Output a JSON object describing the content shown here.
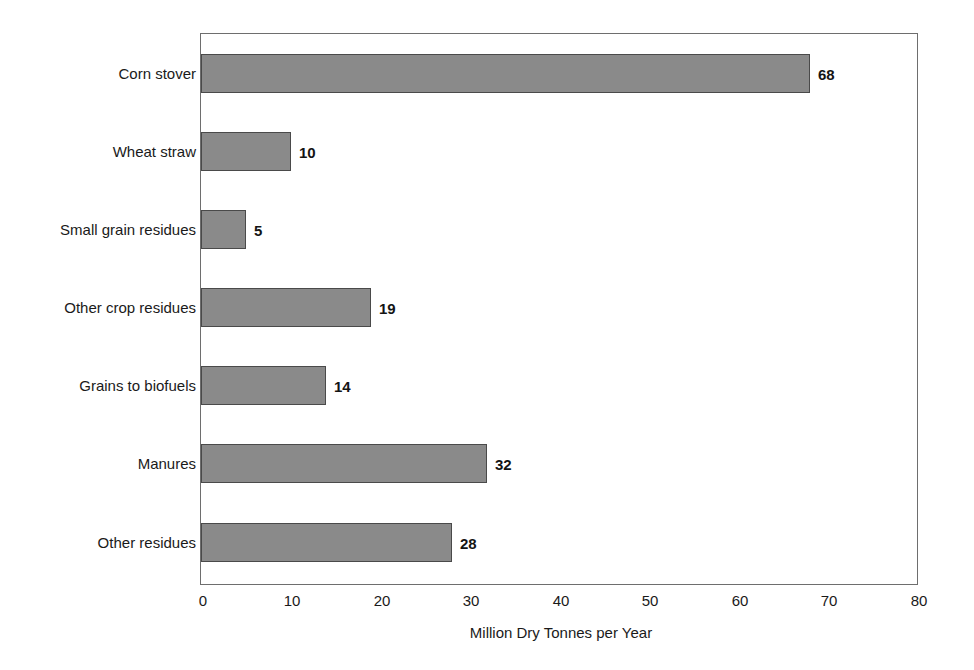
{
  "chart_data": {
    "type": "bar",
    "orientation": "horizontal",
    "title": "",
    "xlabel": "Million Dry Tonnes per Year",
    "ylabel": "",
    "xlim": [
      0,
      80
    ],
    "xticks": [
      0,
      10,
      20,
      30,
      40,
      50,
      60,
      70,
      80
    ],
    "xtick_labels": [
      "0",
      "10",
      "20",
      "30",
      "40",
      "50",
      "60",
      "70",
      "80"
    ],
    "grid": false,
    "legend": false,
    "categories": [
      "Corn stover",
      "Wheat straw",
      "Small grain residues",
      "Other crop residues",
      "Grains to biofuels",
      "Manures",
      "Other residues"
    ],
    "values": [
      68,
      10,
      5,
      19,
      14,
      32,
      28
    ],
    "data_labels": [
      "68",
      "10",
      "5",
      "19",
      "14",
      "32",
      "28"
    ],
    "bar_fill_color": "#8a8a8a",
    "bar_border_color": "#4a4a4a",
    "frame_color": "#6e6e6e",
    "text_color": "#1a1a1a",
    "background_color": "#ffffff"
  }
}
